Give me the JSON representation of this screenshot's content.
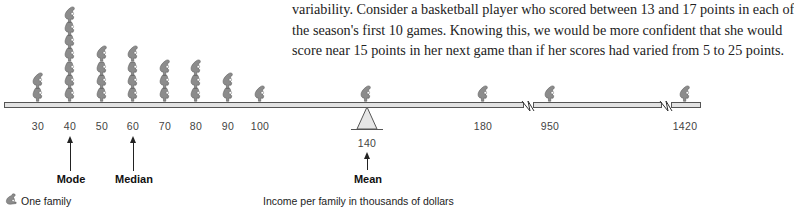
{
  "paragraph": {
    "lines": [
      "variability. Consider a basketball player who scored between 13 and 17 points in each of",
      "the season's first 10 games. Knowing this, we would be more confident that she would",
      "score near 15 points in her next game than if her scores had varied from 5 to 25 points."
    ]
  },
  "diagram": {
    "axis_title": "Income per family in thousands of dollars",
    "legend_label": "One family",
    "legend_icon": "seated-person-icon",
    "figure_color": "#8c8c8c",
    "beam_color": "#e2e2e2",
    "ticks": [
      "30",
      "40",
      "50",
      "60",
      "70",
      "80",
      "90",
      "100",
      "180",
      "950",
      "1420"
    ],
    "mean_tick": "140",
    "stacks": [
      {
        "value": "30",
        "count": 2
      },
      {
        "value": "40",
        "count": 7
      },
      {
        "value": "50",
        "count": 4
      },
      {
        "value": "60",
        "count": 4
      },
      {
        "value": "70",
        "count": 3
      },
      {
        "value": "80",
        "count": 3
      },
      {
        "value": "90",
        "count": 2
      },
      {
        "value": "100",
        "count": 1
      },
      {
        "value": "140",
        "count": 1
      },
      {
        "value": "180",
        "count": 1
      },
      {
        "value": "950",
        "count": 1
      },
      {
        "value": "1420",
        "count": 1
      }
    ],
    "markers": {
      "mode": "Mode",
      "median": "Median",
      "mean": "Mean"
    },
    "axis_breaks": 2
  }
}
